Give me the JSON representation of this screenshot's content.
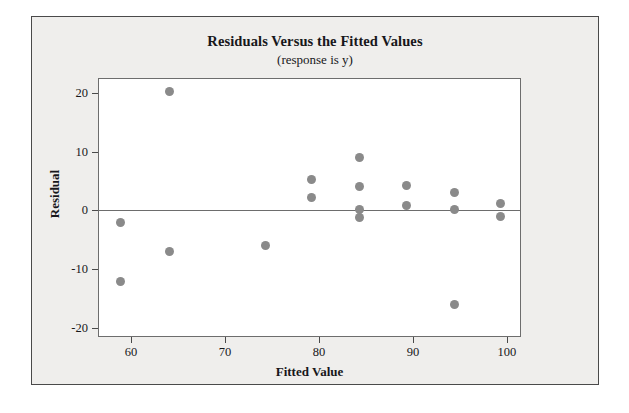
{
  "chart_data": {
    "type": "scatter",
    "title": "Residuals Versus the Fitted Values",
    "subtitle": "(response is y)",
    "xlabel": "Fitted Value",
    "ylabel": "Residual",
    "xlim": [
      56.5,
      101.5
    ],
    "ylim": [
      -21.5,
      22.5
    ],
    "xticks": [
      60,
      70,
      80,
      90,
      100
    ],
    "yticks": [
      20,
      10,
      0,
      -10,
      -20
    ],
    "xtick_labels": [
      "60",
      "70",
      "80",
      "90",
      "100"
    ],
    "ytick_labels": [
      "20",
      "10",
      "0",
      "-10",
      "-20"
    ],
    "grid": false,
    "legend": "none",
    "reference_line": {
      "axis": "y",
      "value": 0
    },
    "marker_color": "#8a8a8a",
    "frame_color": "#6d6d6d",
    "panel_color": "#efeeec",
    "text_color": "#17171a",
    "points": [
      {
        "x": 58.9,
        "y": -2.0
      },
      {
        "x": 58.9,
        "y": -12.0
      },
      {
        "x": 64.1,
        "y": 20.2
      },
      {
        "x": 64.1,
        "y": -7.0
      },
      {
        "x": 74.3,
        "y": -6.0
      },
      {
        "x": 79.2,
        "y": 5.2
      },
      {
        "x": 79.2,
        "y": 2.2
      },
      {
        "x": 84.3,
        "y": 9.0
      },
      {
        "x": 84.3,
        "y": 4.1
      },
      {
        "x": 84.3,
        "y": 0.2
      },
      {
        "x": 84.3,
        "y": -1.2
      },
      {
        "x": 89.3,
        "y": 4.2
      },
      {
        "x": 89.3,
        "y": 0.9
      },
      {
        "x": 94.4,
        "y": 3.0
      },
      {
        "x": 94.4,
        "y": 0.1
      },
      {
        "x": 94.4,
        "y": -16.0
      },
      {
        "x": 99.3,
        "y": 1.2
      },
      {
        "x": 99.3,
        "y": -1.1
      }
    ]
  }
}
